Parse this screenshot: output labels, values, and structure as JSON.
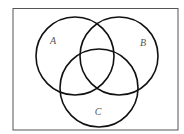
{
  "diagram": {
    "type": "venn",
    "universe": {
      "x": 13,
      "y": 8.5,
      "width": 165,
      "height": 121.5,
      "stroke": "#555555"
    },
    "sets": [
      {
        "label": "A",
        "cx": 75,
        "cy": 56,
        "r": 39,
        "label_x": 53,
        "label_y": 44
      },
      {
        "label": "B",
        "cx": 119,
        "cy": 56,
        "r": 39,
        "label_x": 143,
        "label_y": 46
      },
      {
        "label": "C",
        "cx": 99,
        "cy": 88,
        "r": 39,
        "label_x": 98,
        "label_y": 115
      }
    ],
    "circle_stroke": "#111111"
  }
}
